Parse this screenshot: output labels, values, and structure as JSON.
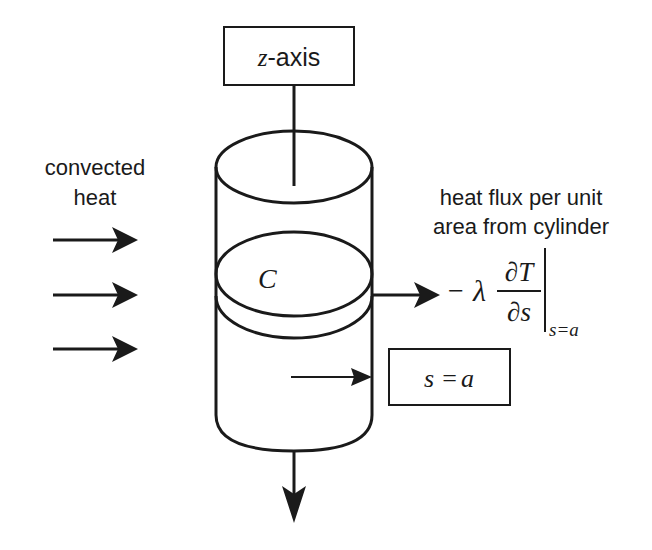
{
  "diagram": {
    "axis_label": {
      "var": "z",
      "suffix": "-axis"
    },
    "left_label": {
      "line1": "convected",
      "line2": "heat"
    },
    "right_label": {
      "line1": "heat flux per unit",
      "line2": "area from cylinder"
    },
    "cylinder_section_label": "C",
    "formula": {
      "minus": "−",
      "lambda": "λ",
      "numerator": "∂T",
      "denominator": "∂s",
      "subscript": "s=a"
    },
    "boundary_box": {
      "lhs": "s",
      "eq": "=",
      "rhs": "a"
    },
    "arrows": {
      "incoming_count": 3,
      "incoming_direction": "right",
      "outgoing_flux_direction": "right",
      "axial_outflow_direction": "down",
      "radius_pointer_direction": "right"
    },
    "colors": {
      "ink": "#1a1a1a",
      "background": "#ffffff"
    }
  }
}
